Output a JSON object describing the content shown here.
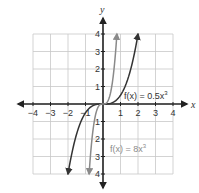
{
  "chart_data": {
    "type": "line",
    "title": "",
    "xlabel": "x",
    "ylabel": "y",
    "xlim": [
      -4,
      4
    ],
    "ylim": [
      -4,
      4
    ],
    "grid": true,
    "x_ticks": [
      "-4",
      "-3",
      "-2",
      "-1",
      "1",
      "2",
      "3",
      "4"
    ],
    "y_ticks": [
      "4",
      "3",
      "2",
      "1",
      "-1",
      "-2",
      "-3",
      "-4"
    ],
    "series": [
      {
        "name": "f(x) = 0.5x^3",
        "label_parts": {
          "prefix": "f(x) = 0.5x",
          "exp": "3"
        },
        "color": "#333333",
        "x": [
          -2,
          -1.5,
          -1,
          -0.5,
          0,
          0.5,
          1,
          1.5,
          2
        ],
        "y": [
          -4,
          -1.69,
          -0.5,
          -0.06,
          0,
          0.06,
          0.5,
          1.69,
          4
        ]
      },
      {
        "name": "f(x) = 8x^3",
        "label_parts": {
          "prefix": "f(x) = 8x",
          "exp": "3"
        },
        "color": "#8a8a8a",
        "x": [
          -0.79,
          -0.6,
          -0.4,
          -0.2,
          0,
          0.2,
          0.4,
          0.6,
          0.79
        ],
        "y": [
          -4,
          -1.73,
          -0.51,
          -0.06,
          0,
          0.06,
          0.51,
          1.73,
          4
        ]
      }
    ]
  }
}
